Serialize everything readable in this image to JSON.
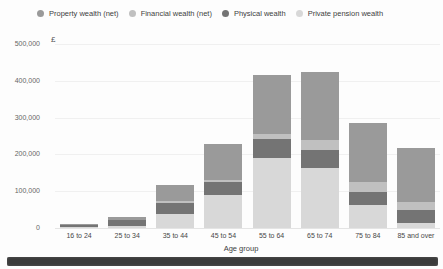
{
  "chart_data": {
    "type": "bar",
    "stacked": true,
    "xlabel": "Age group",
    "ylabel": "£",
    "ylim": [
      0,
      500000
    ],
    "grid": true,
    "legend_position": "top",
    "yticks": [
      {
        "value": 0,
        "label": "0"
      },
      {
        "value": 100000,
        "label": "100,000"
      },
      {
        "value": 200000,
        "label": "200,000"
      },
      {
        "value": 300000,
        "label": "300,000"
      },
      {
        "value": 400000,
        "label": "400,000"
      },
      {
        "value": 500000,
        "label": "500,000"
      }
    ],
    "categories": [
      "16 to 24",
      "25 to 34",
      "35 to 44",
      "45 to 54",
      "55 to 64",
      "65 to 74",
      "75 to 84",
      "85 and over"
    ],
    "stack_order_bottom_to_top": [
      "pension",
      "physical",
      "financial",
      "property"
    ],
    "series": [
      {
        "key": "property",
        "name": "Property wealth (net)",
        "color": "#9a9a9a",
        "values": [
          2000,
          8000,
          45000,
          98000,
          160000,
          185000,
          160000,
          147000
        ]
      },
      {
        "key": "financial",
        "name": "Financial wealth (net)",
        "color": "#c0c0c0",
        "values": [
          1000,
          2000,
          5000,
          5000,
          14000,
          27000,
          27000,
          22000
        ]
      },
      {
        "key": "physical",
        "name": "Physical wealth",
        "color": "#747474",
        "values": [
          5000,
          15000,
          30000,
          35000,
          52000,
          49000,
          35000,
          35000
        ]
      },
      {
        "key": "pension",
        "name": "Private pension wealth",
        "color": "#d8d8d8",
        "values": [
          2000,
          6000,
          38000,
          90000,
          190000,
          163000,
          63000,
          13000
        ]
      }
    ]
  },
  "decor": {
    "bottom_strip_color": "#3b3b3b"
  }
}
